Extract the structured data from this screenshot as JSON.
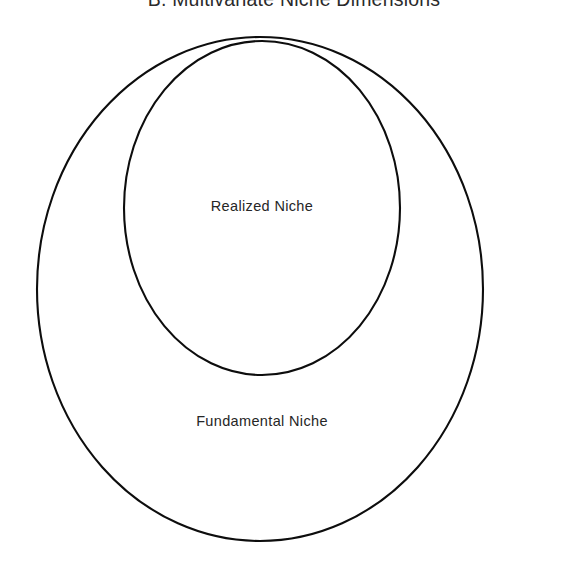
{
  "figure": {
    "title": "B. Multivariate Niche Dimensions",
    "background_color": "#ffffff",
    "stroke_color": "#0d0d0d",
    "text_color": "#262626"
  },
  "shapes": {
    "fundamental": {
      "name": "fundamental-niche-ellipse",
      "cx": 260,
      "cy": 289,
      "rx": 223,
      "ry": 252,
      "stroke_width": 2.1
    },
    "realized": {
      "name": "realized-niche-ellipse",
      "cx": 262,
      "cy": 208,
      "rx": 138,
      "ry": 167,
      "stroke_width": 2.1
    }
  },
  "labels": {
    "realized": "Realized Niche",
    "fundamental": "Fundamental Niche"
  }
}
